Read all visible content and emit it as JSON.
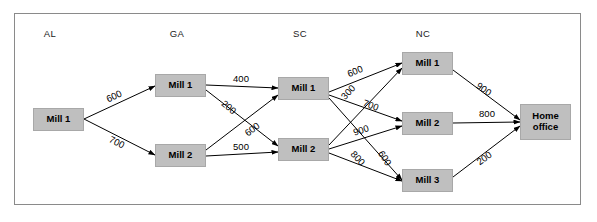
{
  "diagram": {
    "frame": {
      "border_color": "#8a8a8a",
      "background": "#ffffff"
    },
    "node_style": {
      "fill": "#bfbfbf",
      "border": "#a8a8a8",
      "text": "#000000"
    },
    "edge_style": {
      "stroke": "#000000"
    },
    "columns": [
      {
        "id": "al",
        "label": "AL",
        "x": 50
      },
      {
        "id": "ga",
        "label": "GA",
        "x": 177
      },
      {
        "id": "sc",
        "label": "SC",
        "x": 300
      },
      {
        "id": "nc",
        "label": "NC",
        "x": 423
      }
    ],
    "nodes": [
      {
        "id": "al-mill-1",
        "label": "Mill 1",
        "column": "al",
        "x": 33,
        "y": 108,
        "w": 51,
        "h": 23
      },
      {
        "id": "ga-mill-1",
        "label": "Mill 1",
        "column": "ga",
        "x": 155,
        "y": 74,
        "w": 51,
        "h": 23
      },
      {
        "id": "ga-mill-2",
        "label": "Mill 2",
        "column": "ga",
        "x": 155,
        "y": 144,
        "w": 51,
        "h": 23
      },
      {
        "id": "sc-mill-1",
        "label": "Mill 1",
        "column": "sc",
        "x": 278,
        "y": 77,
        "w": 51,
        "h": 23
      },
      {
        "id": "sc-mill-2",
        "label": "Mill 2",
        "column": "sc",
        "x": 278,
        "y": 138,
        "w": 51,
        "h": 23
      },
      {
        "id": "nc-mill-1",
        "label": "Mill 1",
        "column": "nc",
        "x": 402,
        "y": 52,
        "w": 51,
        "h": 23
      },
      {
        "id": "nc-mill-2",
        "label": "Mill 2",
        "column": "nc",
        "x": 402,
        "y": 112,
        "w": 51,
        "h": 23
      },
      {
        "id": "nc-mill-3",
        "label": "Mill 3",
        "column": "nc",
        "x": 402,
        "y": 169,
        "w": 51,
        "h": 23
      },
      {
        "id": "home-office",
        "label": "Home\noffice",
        "column": "home",
        "x": 520,
        "y": 104,
        "w": 51,
        "h": 36
      }
    ],
    "edges": [
      {
        "id": "al1-ga1",
        "from": "al-mill-1",
        "to": "ga-mill-1",
        "label": "600",
        "x1": 84,
        "y1": 119,
        "x2": 155,
        "y2": 86,
        "lx": 114,
        "ly": 96,
        "rot": -25
      },
      {
        "id": "al1-ga2",
        "from": "al-mill-1",
        "to": "ga-mill-2",
        "label": "700",
        "x1": 84,
        "y1": 119,
        "x2": 155,
        "y2": 155,
        "lx": 117,
        "ly": 142,
        "rot": 27
      },
      {
        "id": "ga1-sc1",
        "from": "ga-mill-1",
        "to": "sc-mill-1",
        "label": "400",
        "x1": 206,
        "y1": 85,
        "x2": 278,
        "y2": 88,
        "lx": 241,
        "ly": 78,
        "rot": 0
      },
      {
        "id": "ga1-sc2",
        "from": "ga-mill-1",
        "to": "sc-mill-2",
        "label": "200",
        "x1": 206,
        "y1": 90,
        "x2": 278,
        "y2": 146,
        "lx": 229,
        "ly": 107,
        "rot": 39
      },
      {
        "id": "ga2-sc1",
        "from": "ga-mill-2",
        "to": "sc-mill-1",
        "label": "600",
        "x1": 206,
        "y1": 150,
        "x2": 278,
        "y2": 95,
        "lx": 252,
        "ly": 129,
        "rot": -38
      },
      {
        "id": "ga2-sc2",
        "from": "ga-mill-2",
        "to": "sc-mill-2",
        "label": "500",
        "x1": 206,
        "y1": 156,
        "x2": 278,
        "y2": 152,
        "lx": 241,
        "ly": 146,
        "rot": 0
      },
      {
        "id": "sc1-nc1",
        "from": "sc-mill-1",
        "to": "nc-mill-1",
        "label": "600",
        "x1": 329,
        "y1": 92,
        "x2": 402,
        "y2": 63,
        "lx": 355,
        "ly": 71,
        "rot": -22
      },
      {
        "id": "sc1-nc2",
        "from": "sc-mill-1",
        "to": "nc-mill-2",
        "label": "700",
        "x1": 329,
        "y1": 95,
        "x2": 402,
        "y2": 121,
        "lx": 371,
        "ly": 105,
        "rot": 20
      },
      {
        "id": "sc1-nc3",
        "from": "sc-mill-1",
        "to": "nc-mill-3",
        "label": "800",
        "x1": 329,
        "y1": 98,
        "x2": 402,
        "y2": 180,
        "lx": 358,
        "ly": 158,
        "rot": 48
      },
      {
        "id": "sc2-nc1",
        "from": "sc-mill-2",
        "to": "nc-mill-1",
        "label": "300",
        "x1": 329,
        "y1": 145,
        "x2": 402,
        "y2": 68,
        "lx": 348,
        "ly": 92,
        "rot": -46
      },
      {
        "id": "sc2-nc2",
        "from": "sc-mill-2",
        "to": "nc-mill-2",
        "label": "900",
        "x1": 329,
        "y1": 149,
        "x2": 402,
        "y2": 126,
        "lx": 361,
        "ly": 130,
        "rot": -18
      },
      {
        "id": "sc2-nc3",
        "from": "sc-mill-2",
        "to": "nc-mill-3",
        "label": "600",
        "x1": 329,
        "y1": 153,
        "x2": 402,
        "y2": 181,
        "lx": 385,
        "ly": 158,
        "rot": 58
      },
      {
        "id": "nc1-home",
        "from": "nc-mill-1",
        "to": "home-office",
        "label": "900",
        "x1": 453,
        "y1": 70,
        "x2": 520,
        "y2": 120,
        "lx": 484,
        "ly": 89,
        "rot": 35
      },
      {
        "id": "nc2-home",
        "from": "nc-mill-2",
        "to": "home-office",
        "label": "800",
        "x1": 453,
        "y1": 123,
        "x2": 520,
        "y2": 122,
        "lx": 487,
        "ly": 113,
        "rot": 0
      },
      {
        "id": "nc3-home",
        "from": "nc-mill-3",
        "to": "home-office",
        "label": "200",
        "x1": 453,
        "y1": 177,
        "x2": 520,
        "y2": 126,
        "lx": 484,
        "ly": 158,
        "rot": -36
      }
    ]
  }
}
